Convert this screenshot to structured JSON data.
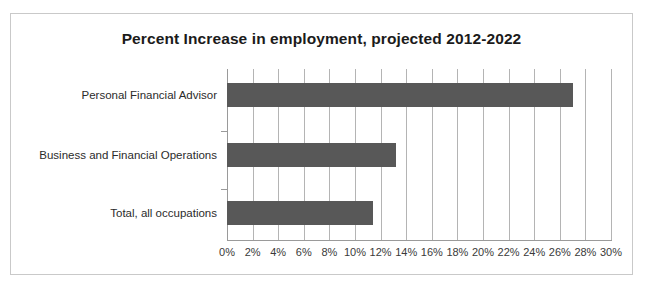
{
  "chart_data": {
    "type": "bar",
    "orientation": "horizontal",
    "title": "Percent Increase in employment, projected 2012-2022",
    "xlabel": "",
    "ylabel": "",
    "categories": [
      "Personal Financial Advisor",
      "Business and Financial Operations",
      "Total, all occupations"
    ],
    "values": [
      27.0,
      13.2,
      11.4
    ],
    "value_suffix": "%",
    "xlim": [
      0,
      30
    ],
    "xtick_step": 2,
    "xticks": [
      0,
      2,
      4,
      6,
      8,
      10,
      12,
      14,
      16,
      18,
      20,
      22,
      24,
      26,
      28,
      30
    ],
    "xtick_labels": [
      "0%",
      "2%",
      "4%",
      "6%",
      "8%",
      "10%",
      "12%",
      "14%",
      "16%",
      "18%",
      "20%",
      "22%",
      "24%",
      "26%",
      "28%",
      "30%"
    ],
    "grid": "vertical",
    "legend": null,
    "bar_color": "#585858",
    "gridline_color": "#b4b4b4",
    "axis_color": "#9a9a9a",
    "title_color": "#1b1b1b",
    "label_color": "#2b2b2b",
    "background": "#ffffff",
    "frame_color": "#c9c9c9"
  }
}
